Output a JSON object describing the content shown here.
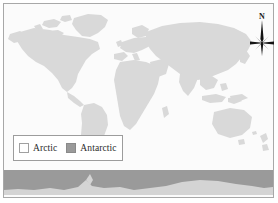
{
  "figure": {
    "background_color": "#ffffff",
    "frame_color": "#a8a8a8",
    "ocean_color": "#fbfbfb",
    "land_color": "#d9d9d9"
  },
  "legend": {
    "border_color": "#9c9c9c",
    "background_color": "#ffffff",
    "entries": [
      {
        "label": "Arctic",
        "swatch_fill": "#ffffff",
        "swatch_stroke": "#a0a0a0",
        "swatch_name": "arctic-swatch"
      },
      {
        "label": "Antarctic",
        "swatch_fill": "#9a9a9a",
        "swatch_stroke": "#8a8a8a",
        "swatch_name": "antarctic-swatch"
      }
    ]
  },
  "compass": {
    "label": "N",
    "icon": "compass-rose-icon",
    "needle_color": "#141414"
  },
  "map": {
    "antarctic_band": {
      "fill": "#9a9a9a",
      "landmass_fill": "#d4d4d4",
      "top_y": 169,
      "bottom_y": 194
    },
    "continents": [
      "North America",
      "Greenland",
      "South America",
      "Europe",
      "Africa",
      "Asia",
      "Australia",
      "New Zealand",
      "Antarctica"
    ]
  }
}
